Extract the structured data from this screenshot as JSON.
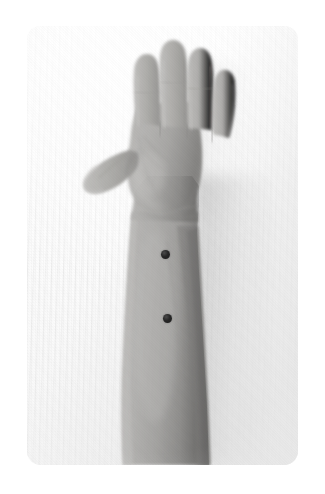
{
  "page": {
    "background_color": "#ffffff",
    "width": 325,
    "height": 494
  },
  "photo": {
    "name": "forearm-photograph",
    "description": "Grayscale photograph of a left forearm and open hand, palm toward the camera, fingers pointing upward, resting on a white ribbed fabric background.",
    "frame": {
      "x": 27,
      "y": 26,
      "width": 271,
      "height": 439,
      "corner_radius": 14
    },
    "color_mode": "grayscale",
    "background": {
      "name": "ribbed-white-fabric",
      "color": "#f4f4f4",
      "texture": "vertical ribbed corduroy weave"
    },
    "subject": {
      "name": "left-forearm-and-hand",
      "skin_tone": "#a9a8a6",
      "skin_highlight": "#c4c3c1",
      "skin_shadow": "#8b8a88",
      "pose": "open palm, fingers extended upward, thumb abducted to the left",
      "parts": [
        {
          "label": "thumb"
        },
        {
          "label": "index finger"
        },
        {
          "label": "middle finger"
        },
        {
          "label": "ring finger"
        },
        {
          "label": "little finger"
        },
        {
          "label": "palm"
        },
        {
          "label": "wrist"
        },
        {
          "label": "forearm"
        }
      ]
    },
    "markers": [
      {
        "name": "marker-proximal",
        "label": "upper forearm marker dot",
        "color": "#1f1f1f",
        "center_x": 165,
        "center_y": 254,
        "diameter": 9
      },
      {
        "name": "marker-distal",
        "label": "lower forearm marker dot",
        "color": "#1f1f1f",
        "center_x": 167,
        "center_y": 318,
        "diameter": 9
      }
    ]
  }
}
